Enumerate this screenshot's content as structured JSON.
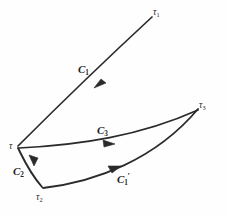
{
  "figure": {
    "type": "mathematical-curve-diagram",
    "background_color": "#fefefe",
    "stroke_color": "#2a2a2a",
    "nodes": [
      {
        "id": "tau",
        "label": "τ",
        "subscript": "",
        "x": 17,
        "y": 147
      },
      {
        "id": "tau1",
        "label": "τ",
        "subscript": "1",
        "x": 153,
        "y": 14
      },
      {
        "id": "tau2",
        "label": "τ",
        "subscript": "2",
        "x": 43,
        "y": 189
      },
      {
        "id": "tau3",
        "label": "τ",
        "subscript": "3",
        "x": 200,
        "y": 108
      }
    ],
    "curves": [
      {
        "id": "C1",
        "label": "C",
        "subscript": "1",
        "prime": "",
        "from": "tau",
        "to": "tau1",
        "label_x": 78,
        "label_y": 62,
        "arrow_at": {
          "x": 101,
          "y": 79
        }
      },
      {
        "id": "C2",
        "label": "C",
        "subscript": "2",
        "prime": "",
        "from": "tau",
        "to": "tau2",
        "label_x": 14,
        "label_y": 165,
        "arrow_at": {
          "x": 33,
          "y": 165
        }
      },
      {
        "id": "C3",
        "label": "C",
        "subscript": "3",
        "prime": "",
        "from": "tau",
        "to": "tau3",
        "label_x": 97,
        "label_y": 123,
        "arrow_at": {
          "x": 113,
          "y": 144
        }
      },
      {
        "id": "C1prime",
        "label": "C",
        "subscript": "1",
        "prime": "′",
        "from": "tau2",
        "to": "tau3",
        "label_x": 117,
        "label_y": 172,
        "arrow_at": {
          "x": 118,
          "y": 166
        }
      }
    ]
  }
}
